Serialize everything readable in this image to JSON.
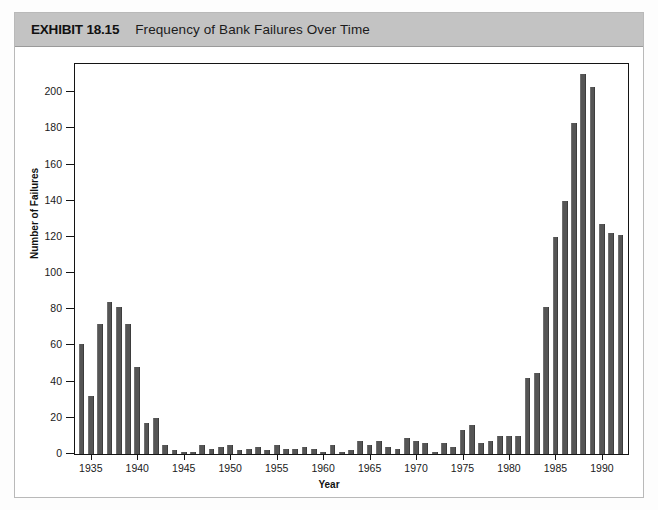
{
  "header": {
    "exhibit_label": "EXHIBIT 18.15",
    "title": "Frequency of Bank Failures Over Time",
    "band_color": "#c3c3c3"
  },
  "colors": {
    "bar": "#555555",
    "axis": "#141414",
    "page_background": "#ffffff",
    "frame_border": "#b9b9b9"
  },
  "chart_data": {
    "type": "bar",
    "title": "Frequency of Bank Failures Over Time",
    "xlabel": "Year",
    "ylabel": "Number of Failures",
    "ylim": [
      0,
      215
    ],
    "xlim": [
      1933.3,
      1992.7
    ],
    "grid": false,
    "legend": false,
    "y_ticks": [
      0,
      20,
      40,
      60,
      80,
      100,
      120,
      140,
      160,
      180,
      200
    ],
    "y_tick_labels": [
      "0",
      "20",
      "40",
      "60",
      "80",
      "100",
      "120",
      "140",
      "160",
      "180",
      "200"
    ],
    "x_ticks": [
      1935,
      1940,
      1945,
      1950,
      1955,
      1960,
      1965,
      1970,
      1975,
      1980,
      1985,
      1990
    ],
    "x_tick_labels": [
      "1935",
      "1940",
      "1945",
      "1950",
      "1955",
      "1960",
      "1965",
      "1970",
      "1975",
      "1980",
      "1985",
      "1990"
    ],
    "categories": [
      1934,
      1935,
      1936,
      1937,
      1938,
      1939,
      1940,
      1941,
      1942,
      1943,
      1944,
      1945,
      1946,
      1947,
      1948,
      1949,
      1950,
      1951,
      1952,
      1953,
      1954,
      1955,
      1956,
      1957,
      1958,
      1959,
      1960,
      1961,
      1962,
      1963,
      1964,
      1965,
      1966,
      1967,
      1968,
      1969,
      1970,
      1971,
      1972,
      1973,
      1974,
      1975,
      1976,
      1977,
      1978,
      1979,
      1980,
      1981,
      1982,
      1983,
      1984,
      1985,
      1986,
      1987,
      1988,
      1989,
      1990,
      1991,
      1992
    ],
    "values": [
      61,
      32,
      72,
      84,
      81,
      72,
      48,
      17,
      20,
      5,
      2,
      1,
      1,
      5,
      3,
      4,
      5,
      2,
      3,
      4,
      2,
      5,
      3,
      3,
      4,
      3,
      1,
      5,
      1,
      2,
      7,
      5,
      7,
      4,
      3,
      9,
      7,
      6,
      1,
      6,
      4,
      13,
      16,
      6,
      7,
      10,
      10,
      10,
      42,
      45,
      81,
      120,
      140,
      183,
      210,
      203,
      127,
      122,
      121
    ]
  }
}
